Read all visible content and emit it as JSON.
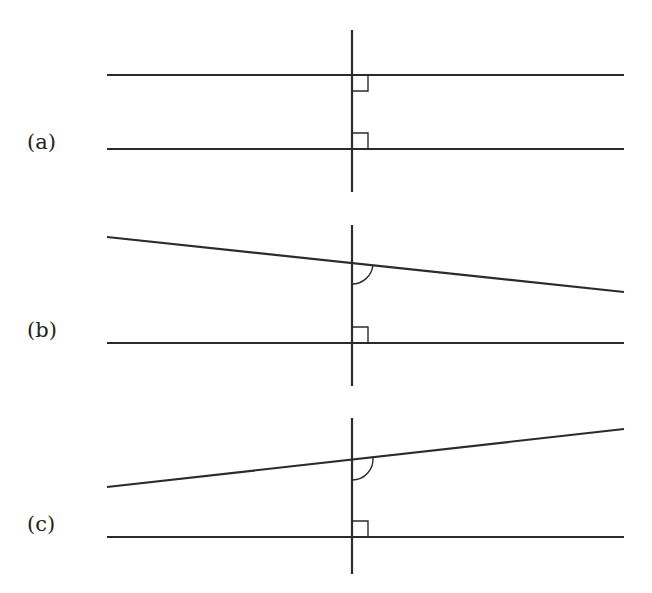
{
  "diagram": {
    "line_color": "#2b2b2b",
    "panels": [
      {
        "label": "(a)",
        "description": "Two parallel horizontal lines both perpendicular to a vertical transversal",
        "top_line": {
          "x1": 107,
          "y1": 75,
          "x2": 624,
          "y2": 75
        },
        "bottom_line": {
          "x1": 107,
          "y1": 149,
          "x2": 624,
          "y2": 149
        },
        "transversal": {
          "x": 352,
          "y1": 30,
          "y2": 192
        },
        "top_marker": "right-angle",
        "bottom_marker": "right-angle"
      },
      {
        "label": "(b)",
        "description": "Top line slopes downward to the right; bottom line horizontal and perpendicular",
        "top_line": {
          "x1": 107,
          "y1": 237,
          "x2": 624,
          "y2": 292
        },
        "bottom_line": {
          "x1": 107,
          "y1": 343,
          "x2": 624,
          "y2": 343
        },
        "transversal": {
          "x": 352,
          "y1": 225,
          "y2": 386
        },
        "top_marker": "angle-arc",
        "bottom_marker": "right-angle"
      },
      {
        "label": "(c)",
        "description": "Top line slopes upward to the right; bottom line horizontal and perpendicular",
        "top_line": {
          "x1": 107,
          "y1": 487,
          "x2": 624,
          "y2": 429
        },
        "bottom_line": {
          "x1": 107,
          "y1": 537,
          "x2": 624,
          "y2": 537
        },
        "transversal": {
          "x": 352,
          "y1": 418,
          "y2": 574
        },
        "top_marker": "angle-arc",
        "bottom_marker": "right-angle"
      }
    ]
  }
}
